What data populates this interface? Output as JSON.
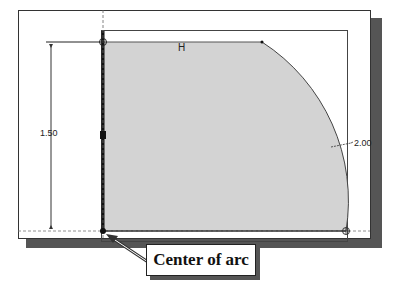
{
  "diagram": {
    "constraint_label": "H",
    "vertical_dimension": "1.50",
    "radius_dimension": "2.00",
    "callout_text": "Center of arc"
  },
  "colors": {
    "fill": "#d3d3d3",
    "shadow": "#555555",
    "line": "#111111"
  }
}
